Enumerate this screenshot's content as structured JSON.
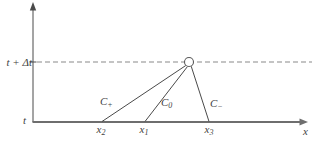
{
  "figure": {
    "background": "#ffffff",
    "axis_color": "#6e6e6e",
    "line_color": "#4a4a4a",
    "dashed_color": "#8a8a8a",
    "text_color": "#3f3f3f"
  },
  "labels": {
    "t_axis_upper": "t + Δt",
    "t_axis_lower": "t",
    "x_axis": "x",
    "x_points": [
      {
        "base": "x",
        "sub": "2"
      },
      {
        "base": "x",
        "sub": "1"
      },
      {
        "base": "x",
        "sub": "3"
      }
    ],
    "characteristics": [
      {
        "base": "C",
        "sub": "+"
      },
      {
        "base": "C",
        "sub": "0"
      },
      {
        "base": "C",
        "sub": "−"
      }
    ]
  }
}
